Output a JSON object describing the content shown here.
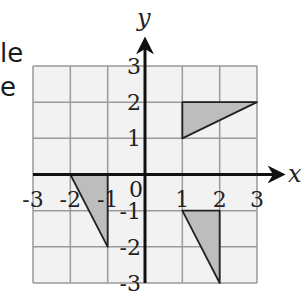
{
  "partial_text": {
    "line1": "le",
    "line2": "e"
  },
  "diagram": {
    "type": "coordinate-grid",
    "x_axis_label": "x",
    "y_axis_label": "y",
    "origin_label": "0",
    "x_range": [
      -3,
      3
    ],
    "y_range": [
      -3,
      3
    ],
    "x_tick_labels": [
      "-3",
      "-2",
      "-1",
      "1",
      "2",
      "3"
    ],
    "y_tick_labels": [
      "3",
      "2",
      "1",
      "-1",
      "-2",
      "-3"
    ],
    "grid_color": "#9a9a9a",
    "grid_fill": "#f2f2f2",
    "shape_fill": "#bdbdbd",
    "shapes": [
      {
        "name": "triangle-a",
        "vertices": [
          [
            1,
            2
          ],
          [
            3,
            2
          ],
          [
            1,
            1
          ]
        ]
      },
      {
        "name": "triangle-b",
        "vertices": [
          [
            -2,
            0
          ],
          [
            -1,
            0
          ],
          [
            -1,
            -2
          ]
        ]
      },
      {
        "name": "triangle-c",
        "vertices": [
          [
            1,
            -1
          ],
          [
            2,
            -1
          ],
          [
            2,
            -3
          ]
        ]
      }
    ]
  }
}
